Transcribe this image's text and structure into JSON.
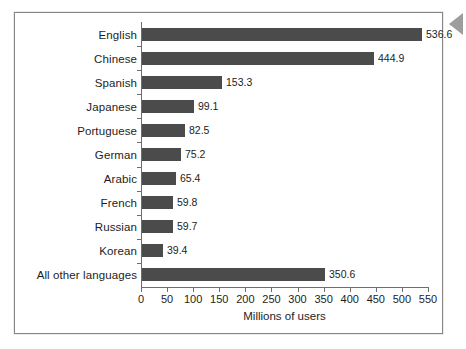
{
  "figure": {
    "frame_border_color": "#868686",
    "background_color": "#ffffff",
    "edge_marker_icon": "left-arrow-icon",
    "edge_marker_color": "#9d9d9d"
  },
  "chart_data": {
    "type": "bar",
    "orientation": "horizontal",
    "title": "",
    "subtitle": "",
    "xlabel": "Millions of users",
    "ylabel": "",
    "xlim": [
      0,
      550
    ],
    "xticks": [
      0,
      50,
      100,
      150,
      200,
      250,
      300,
      350,
      400,
      450,
      500,
      550
    ],
    "xtick_labels": [
      "0",
      "50",
      "100",
      "150",
      "200",
      "250",
      "300",
      "350",
      "400",
      "450",
      "500",
      "550"
    ],
    "grid": false,
    "legend": null,
    "bar_color": "#4b4b4b",
    "categories": [
      "English",
      "Chinese",
      "Spanish",
      "Japanese",
      "Portuguese",
      "German",
      "Arabic",
      "French",
      "Russian",
      "Korean",
      "All other languages"
    ],
    "values": [
      536.6,
      444.9,
      153.3,
      99.1,
      82.5,
      75.2,
      65.4,
      59.8,
      59.7,
      39.4,
      350.6
    ],
    "value_labels": [
      "536.6",
      "444.9",
      "153.3",
      "99.1",
      "82.5",
      "75.2",
      "65.4",
      "59.8",
      "59.7",
      "39.4",
      "350.6"
    ]
  }
}
